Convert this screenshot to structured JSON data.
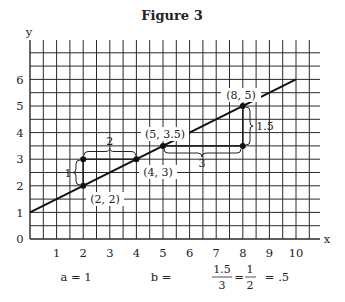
{
  "figure": {
    "title": "Figure 3",
    "x_axis_label": "x",
    "y_axis_label": "y",
    "origin_label": "0",
    "x_ticks": [
      "1",
      "2",
      "3",
      "4",
      "5",
      "6",
      "7",
      "8",
      "9",
      "10"
    ],
    "y_ticks": [
      "1",
      "2",
      "3",
      "4",
      "5",
      "6"
    ],
    "points": [
      {
        "label": "(2, 2)",
        "x": 2,
        "y": 2
      },
      {
        "label": "(4, 3)",
        "x": 4,
        "y": 3
      },
      {
        "label": "(5, 3.5)",
        "x": 5,
        "y": 3.5
      },
      {
        "label": "(8, 5)",
        "x": 8,
        "y": 5
      }
    ],
    "brackets": {
      "rise_small": "1",
      "run_small": "2",
      "rise_large": "1.5",
      "run_large": "3"
    },
    "formulas": {
      "a": "a = 1",
      "b_prefix": "b =",
      "b_frac1_num": "1.5",
      "b_frac1_den": "3",
      "eq": "=",
      "b_frac2_num": "1",
      "b_frac2_den": "2",
      "b_result": "= .5"
    }
  },
  "chart_data": {
    "type": "line",
    "title": "Figure 3",
    "xlabel": "x",
    "ylabel": "y",
    "xlim": [
      0,
      10.5
    ],
    "ylim": [
      0,
      7
    ],
    "grid": true,
    "grid_step": 0.5,
    "series": [
      {
        "name": "y = 1 + .5x",
        "x": [
          0,
          10
        ],
        "y": [
          1,
          6
        ]
      }
    ],
    "marked_points": [
      [
        2,
        2
      ],
      [
        2,
        3
      ],
      [
        4,
        3
      ],
      [
        5,
        3.5
      ],
      [
        8,
        3.5
      ],
      [
        8,
        5
      ]
    ],
    "annotations": [
      {
        "text": "(2, 2)",
        "at": [
          2,
          2
        ]
      },
      {
        "text": "(4, 3)",
        "at": [
          4,
          3
        ]
      },
      {
        "text": "(5, 3.5)",
        "at": [
          5,
          3.5
        ]
      },
      {
        "text": "(8, 5)",
        "at": [
          8,
          5
        ]
      },
      {
        "text": "1",
        "type": "rise",
        "from": [
          2,
          2
        ],
        "to": [
          2,
          3
        ]
      },
      {
        "text": "2",
        "type": "run",
        "from": [
          2,
          3
        ],
        "to": [
          4,
          3
        ]
      },
      {
        "text": "1.5",
        "type": "rise",
        "from": [
          8,
          3.5
        ],
        "to": [
          8,
          5
        ]
      },
      {
        "text": "3",
        "type": "run",
        "from": [
          5,
          3.5
        ],
        "to": [
          8,
          3.5
        ]
      },
      {
        "text": "a = 1"
      },
      {
        "text": "b = 1.5/3 = 1/2 = .5"
      }
    ],
    "intercept_a": 1,
    "slope_b": 0.5
  }
}
